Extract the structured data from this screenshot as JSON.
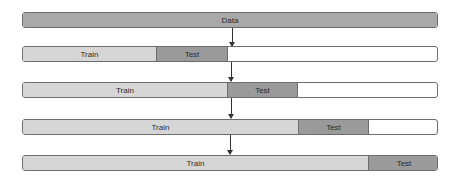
{
  "diagram": {
    "data_label": "Data",
    "rows": [
      {
        "train_label": "Train",
        "test_label": "Test",
        "train_end": 133,
        "test_end": 205
      },
      {
        "train_label": "Train",
        "test_label": "Test",
        "train_end": 204,
        "test_end": 275
      },
      {
        "train_label": "Train",
        "test_label": "Test",
        "train_end": 275,
        "test_end": 346
      },
      {
        "train_label": "Train",
        "test_label": "Test",
        "train_end": 345,
        "test_end": 416
      }
    ]
  }
}
